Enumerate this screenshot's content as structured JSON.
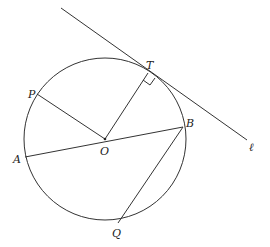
{
  "diagram": {
    "type": "geometry",
    "circle": {
      "center": "O",
      "cx": 105,
      "cy": 139,
      "r": 81
    },
    "points": {
      "O": {
        "label": "O",
        "x": 105,
        "y": 139
      },
      "T": {
        "label": "T",
        "x": 148,
        "y": 73
      },
      "P": {
        "label": "P",
        "x": 37,
        "y": 94
      },
      "A": {
        "label": "A",
        "x": 25,
        "y": 157
      },
      "B": {
        "label": "B",
        "x": 183,
        "y": 127
      },
      "Q": {
        "label": "Q",
        "x": 118,
        "y": 223
      }
    },
    "tangent_line": {
      "label": "ℓ",
      "x1": 61,
      "y1": 8,
      "x2": 247,
      "y2": 140
    },
    "segments": [
      "OP",
      "OT",
      "AB",
      "BQ"
    ],
    "right_angle_at": "T"
  }
}
